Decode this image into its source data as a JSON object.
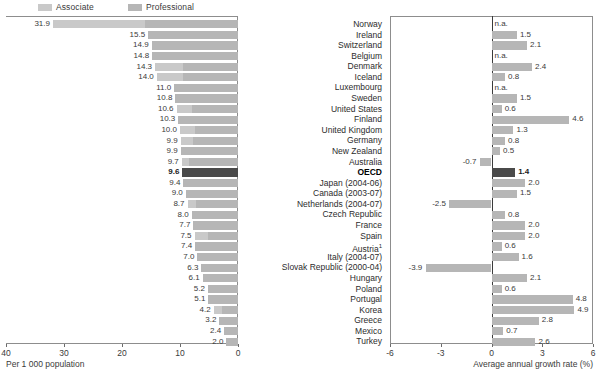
{
  "legend": {
    "items": [
      {
        "label": "Associate",
        "color": "#c9c9c9"
      },
      {
        "label": "Professional",
        "color": "#b6b6b6"
      }
    ]
  },
  "left_axis": {
    "title": "Per 1 000 population",
    "ticks": [
      "40",
      "30",
      "20",
      "10",
      "0"
    ]
  },
  "right_axis": {
    "title": "Average annual growth rate (%)",
    "ticks": [
      "-6",
      "-3",
      "0",
      "3",
      "6"
    ]
  },
  "chart_data": [
    {
      "type": "bar",
      "id": "nurses-per-1000",
      "title": "Per 1 000 population",
      "orientation": "horizontal-reversed",
      "xlabel": "Per 1 000 population",
      "ylabel": "",
      "xlim": [
        0,
        40
      ],
      "grid": false,
      "legend": [
        "Associate",
        "Professional"
      ],
      "legend_position": "top",
      "categories": [
        "Norway",
        "Ireland",
        "Switzerland",
        "Belgium",
        "Denmark",
        "Iceland",
        "Luxembourg",
        "Sweden",
        "United States",
        "Finland",
        "United Kingdom",
        "Germany",
        "New Zealand",
        "Australia",
        "OECD",
        "Japan (2004-06)",
        "Canada (2003-07)",
        "Netherlands (2004-07)",
        "Czech Republic",
        "France",
        "Spain",
        "Austria¹",
        "Italy (2004-07)",
        "Slovak Republic (2000-04)",
        "Hungary",
        "Poland",
        "Portugal",
        "Korea",
        "Greece",
        "Mexico",
        "Turkey"
      ],
      "values": [
        31.9,
        15.5,
        14.9,
        14.8,
        14.3,
        14.0,
        11.0,
        10.8,
        10.6,
        10.3,
        10.0,
        9.9,
        9.9,
        9.7,
        9.6,
        9.4,
        9.0,
        8.7,
        8.0,
        7.7,
        7.5,
        7.4,
        7.0,
        6.3,
        6.1,
        5.2,
        5.1,
        4.2,
        3.2,
        2.4,
        2.0
      ],
      "labels": [
        "31.9",
        "15.5",
        "14.9",
        "14.8",
        "14.3",
        "14.0",
        "11.0",
        "10.8",
        "10.6",
        "10.3",
        "10.0",
        "9.9",
        "9.9",
        "9.7",
        "9.6",
        "9.4",
        "9.0",
        "8.7",
        "8.0",
        "7.7",
        "7.5",
        "7.4",
        "7.0",
        "6.3",
        "6.1",
        "5.2",
        "5.1",
        "4.2",
        "3.2",
        "2.4",
        "2.0"
      ],
      "series": [
        {
          "name": "Associate",
          "values": [
            15.9,
            0.0,
            0.0,
            0.0,
            4.9,
            4.6,
            0.0,
            0.0,
            2.7,
            0.0,
            2.5,
            2.2,
            0.0,
            1.3,
            0.0,
            0.0,
            0.0,
            1.5,
            0.0,
            0.0,
            2.3,
            0.0,
            0.0,
            0.0,
            0.0,
            0.0,
            0.0,
            1.4,
            0.0,
            0.0,
            0.0
          ]
        },
        {
          "name": "Professional",
          "values": [
            16.0,
            15.5,
            14.9,
            14.8,
            9.4,
            9.4,
            11.0,
            10.8,
            7.9,
            10.3,
            7.5,
            7.7,
            9.9,
            8.4,
            9.6,
            9.4,
            9.0,
            7.2,
            8.0,
            7.7,
            5.2,
            7.4,
            7.0,
            6.3,
            6.1,
            5.2,
            5.1,
            2.8,
            3.2,
            2.4,
            2.0
          ]
        }
      ],
      "highlight_category": "OECD"
    },
    {
      "type": "bar",
      "id": "nurses-growth-rate",
      "title": "Average annual growth rate (%)",
      "orientation": "horizontal",
      "xlabel": "Average annual growth rate (%)",
      "ylabel": "",
      "xlim": [
        -6,
        6
      ],
      "grid": false,
      "legend": [],
      "categories": [
        "Norway",
        "Ireland",
        "Switzerland",
        "Belgium",
        "Denmark",
        "Iceland",
        "Luxembourg",
        "Sweden",
        "United States",
        "Finland",
        "United Kingdom",
        "Germany",
        "New Zealand",
        "Australia",
        "OECD",
        "Japan (2004-06)",
        "Canada (2003-07)",
        "Netherlands (2004-07)",
        "Czech Republic",
        "France",
        "Spain",
        "Austria¹",
        "Italy (2004-07)",
        "Slovak Republic (2000-04)",
        "Hungary",
        "Poland",
        "Portugal",
        "Korea",
        "Greece",
        "Mexico",
        "Turkey"
      ],
      "values": [
        null,
        1.5,
        2.1,
        null,
        2.4,
        0.8,
        null,
        1.5,
        0.6,
        4.6,
        1.3,
        0.8,
        0.5,
        -0.7,
        1.4,
        2.0,
        1.5,
        -2.5,
        0.8,
        2.0,
        2.0,
        0.6,
        1.6,
        -3.9,
        2.1,
        0.6,
        4.8,
        4.9,
        2.8,
        0.7,
        2.6
      ],
      "labels": [
        "n.a.",
        "1.5",
        "2.1",
        "n.a.",
        "2.4",
        "0.8",
        "n.a.",
        "1.5",
        "0.6",
        "4.6",
        "1.3",
        "0.8",
        "0.5",
        "-0.7",
        "1.4",
        "2.0",
        "1.5",
        "-2.5",
        "0.8",
        "2.0",
        "2.0",
        "0.6",
        "1.6",
        "-3.9",
        "2.1",
        "0.6",
        "4.8",
        "4.9",
        "2.8",
        "0.7",
        "2.6"
      ],
      "highlight_category": "OECD"
    }
  ],
  "rows": [
    {
      "name": "Norway",
      "name_sup": "",
      "left": "31.9",
      "right": "n.a."
    },
    {
      "name": "Ireland",
      "name_sup": "",
      "left": "15.5",
      "right": "1.5"
    },
    {
      "name": "Switzerland",
      "name_sup": "",
      "left": "14.9",
      "right": "2.1"
    },
    {
      "name": "Belgium",
      "name_sup": "",
      "left": "14.8",
      "right": "n.a."
    },
    {
      "name": "Denmark",
      "name_sup": "",
      "left": "14.3",
      "right": "2.4"
    },
    {
      "name": "Iceland",
      "name_sup": "",
      "left": "14.0",
      "right": "0.8"
    },
    {
      "name": "Luxembourg",
      "name_sup": "",
      "left": "11.0",
      "right": "n.a."
    },
    {
      "name": "Sweden",
      "name_sup": "",
      "left": "10.8",
      "right": "1.5"
    },
    {
      "name": "United States",
      "name_sup": "",
      "left": "10.6",
      "right": "0.6"
    },
    {
      "name": "Finland",
      "name_sup": "",
      "left": "10.3",
      "right": "4.6"
    },
    {
      "name": "United Kingdom",
      "name_sup": "",
      "left": "10.0",
      "right": "1.3"
    },
    {
      "name": "Germany",
      "name_sup": "",
      "left": "9.9",
      "right": "0.8"
    },
    {
      "name": "New Zealand",
      "name_sup": "",
      "left": "9.9",
      "right": "0.5"
    },
    {
      "name": "Australia",
      "name_sup": "",
      "left": "9.7",
      "right": "-0.7"
    },
    {
      "name": "OECD",
      "name_sup": "",
      "left": "9.6",
      "right": "1.4"
    },
    {
      "name": "Japan (2004-06)",
      "name_sup": "",
      "left": "9.4",
      "right": "2.0"
    },
    {
      "name": "Canada (2003-07)",
      "name_sup": "",
      "left": "9.0",
      "right": "1.5"
    },
    {
      "name": "Netherlands (2004-07)",
      "name_sup": "",
      "left": "8.7",
      "right": "-2.5"
    },
    {
      "name": "Czech Republic",
      "name_sup": "",
      "left": "8.0",
      "right": "0.8"
    },
    {
      "name": "France",
      "name_sup": "",
      "left": "7.7",
      "right": "2.0"
    },
    {
      "name": "Spain",
      "name_sup": "",
      "left": "7.5",
      "right": "2.0"
    },
    {
      "name": "Austria",
      "name_sup": "1",
      "left": "7.4",
      "right": "0.6"
    },
    {
      "name": "Italy (2004-07)",
      "name_sup": "",
      "left": "7.0",
      "right": "1.6"
    },
    {
      "name": "Slovak Republic (2000-04)",
      "name_sup": "",
      "left": "6.3",
      "right": "-3.9"
    },
    {
      "name": "Hungary",
      "name_sup": "",
      "left": "6.1",
      "right": "2.1"
    },
    {
      "name": "Poland",
      "name_sup": "",
      "left": "5.2",
      "right": "0.6"
    },
    {
      "name": "Portugal",
      "name_sup": "",
      "left": "5.1",
      "right": "4.8"
    },
    {
      "name": "Korea",
      "name_sup": "",
      "left": "4.2",
      "right": "4.9"
    },
    {
      "name": "Greece",
      "name_sup": "",
      "left": "3.2",
      "right": "2.8"
    },
    {
      "name": "Mexico",
      "name_sup": "",
      "left": "2.4",
      "right": "0.7"
    },
    {
      "name": "Turkey",
      "name_sup": "",
      "left": "2.0",
      "right": "2.6"
    }
  ]
}
